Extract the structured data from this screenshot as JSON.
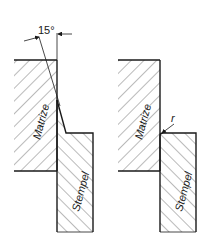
{
  "figure": {
    "left": {
      "die_label": "Matrize",
      "punch_label": "Stempel",
      "angle_label": "15°"
    },
    "right": {
      "die_label": "Matrize",
      "punch_label": "Stempel",
      "radius_label": "r"
    }
  },
  "colors": {
    "line": "#1a1a1a",
    "hatch": "#3a3a3a",
    "background": "#ffffff"
  }
}
